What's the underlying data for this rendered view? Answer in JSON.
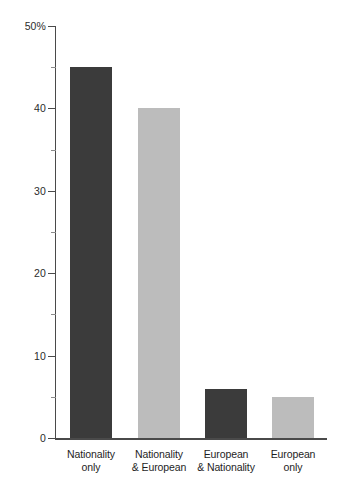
{
  "chart_data": {
    "type": "bar",
    "title": "",
    "subtitle": "",
    "xlabel": "",
    "ylabel": "",
    "ylim": [
      0,
      50
    ],
    "grid": false,
    "legend": "none",
    "unit": "%",
    "categories": [
      "Nationality only",
      "Nationality & European",
      "European & Nationality",
      "European only"
    ],
    "category_lines": [
      [
        "Nationality",
        "only"
      ],
      [
        "Nationality",
        "& European"
      ],
      [
        "European",
        "& Nationality"
      ],
      [
        "European",
        "only"
      ]
    ],
    "values": [
      45,
      40,
      6,
      5
    ],
    "bar_colors": [
      "#3b3b3b",
      "#bcbcbc",
      "#3b3b3b",
      "#bcbcbc"
    ],
    "y_ticks_major": [
      0,
      10,
      20,
      30,
      40,
      50
    ],
    "y_tick_labels": [
      "0",
      "10",
      "20",
      "30",
      "40",
      "50%"
    ],
    "y_ticks_minor": [
      5,
      15,
      25,
      35,
      45
    ],
    "axis_color": "#4a4a4a",
    "background": "#ffffff"
  }
}
